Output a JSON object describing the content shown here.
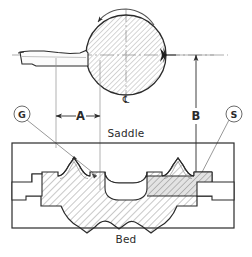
{
  "drawing": {
    "title": "Lathe bed and saddle cross-section",
    "parts": {
      "saddle_label": "Saddle",
      "bed_label": "Bed"
    },
    "dimensions": [
      {
        "id": "A",
        "label": "A",
        "orientation": "horizontal",
        "meaning": "tool-tip to workpiece centre distance"
      },
      {
        "id": "B",
        "label": "B",
        "orientation": "vertical",
        "meaning": "workpiece centre height above slideway"
      }
    ],
    "callouts": [
      {
        "id": "G",
        "label": "G",
        "target": "left-vee-guideway"
      },
      {
        "id": "S",
        "label": "S",
        "target": "right-flat-slideway"
      }
    ],
    "centreline_symbol": "℄",
    "workpiece": {
      "name": "workpiece",
      "rotation_arrow": "counter-clockwise-rotation-arrow",
      "feed_arrow": "feed-direction-arrow"
    },
    "tool": {
      "name": "cutting-tool"
    },
    "colors": {
      "line": "#2b2b2b",
      "thin_line": "#5a5a5a",
      "hatch": "#6e6e6e",
      "fill_light": "#f2f2f2",
      "fill_shaded": "#d9d9d9",
      "background": "#ffffff"
    }
  }
}
